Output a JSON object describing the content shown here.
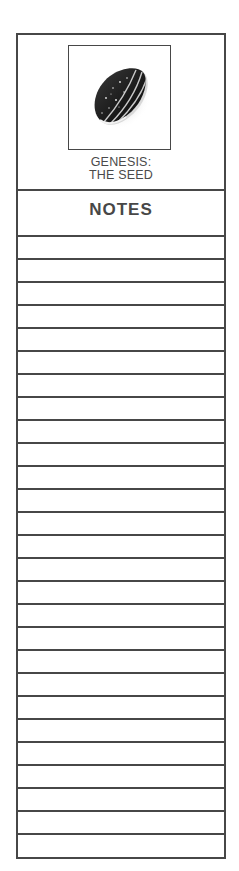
{
  "bookmark": {
    "image": {
      "icon": "sunflower-seed-image",
      "description": "striped sunflower seed"
    },
    "title": {
      "line1": "GENESIS:",
      "line2": "THE SEED"
    },
    "notes_label": "NOTES",
    "line_count": 27,
    "colors": {
      "border": "#474747",
      "text": "#4a4a4a",
      "background": "#ffffff"
    }
  }
}
